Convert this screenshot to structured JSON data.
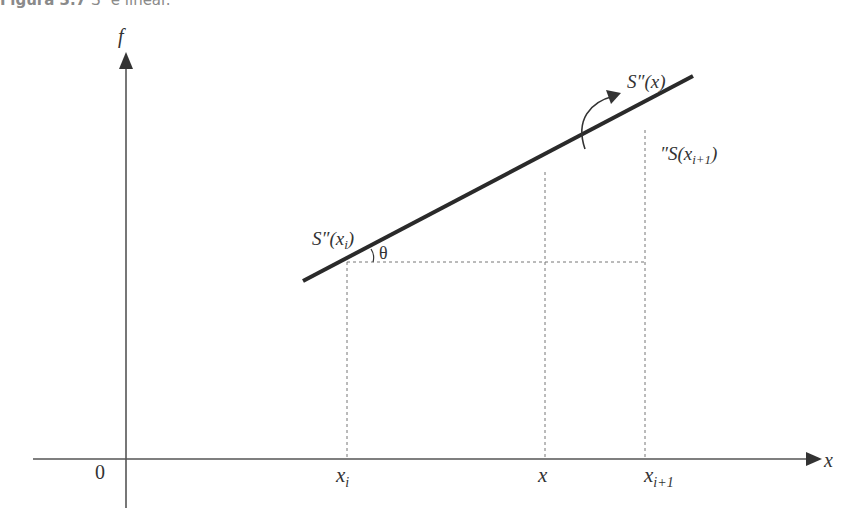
{
  "caption": {
    "number": "Figura 3.7",
    "text": "S″ é linear."
  },
  "axes": {
    "y_label": "f",
    "x_label": "x",
    "origin_label": "0"
  },
  "ticks": {
    "xi": {
      "base": "x",
      "sub": "i"
    },
    "x": {
      "base": "x"
    },
    "xi1": {
      "base": "x",
      "sub": "i+1"
    }
  },
  "labels": {
    "s_x": "S″(x)",
    "s_xi_prefix": "S″(x",
    "s_xi_sub": "i",
    "s_xi_suffix": ")",
    "s_xi1_prefix": "″S(x",
    "s_xi1_sub": "i+1",
    "s_xi1_suffix": ")",
    "theta": "θ"
  },
  "colors": {
    "line": "#2a2a2a",
    "axis": "#555555",
    "dashed": "#777777",
    "text": "#333333",
    "caption": "#8a8a8a"
  }
}
